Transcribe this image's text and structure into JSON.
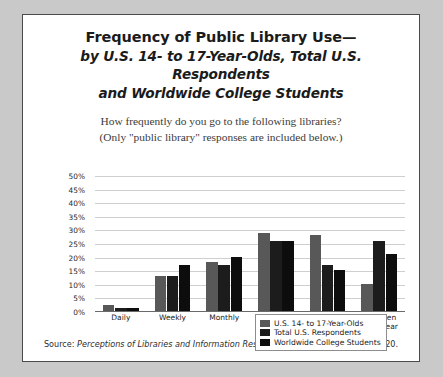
{
  "title": {
    "line1": "Frequency of Public Library Use—",
    "line2": "by U.S. 14- to 17-Year-Olds, Total U.S. Respondents",
    "line3": "and Worldwide College Students"
  },
  "subtitle": {
    "line1": "How frequently do you go to the following libraries?",
    "line2": "(Only \"public library\" responses are included below.)"
  },
  "source": {
    "prefix": "Source:",
    "italic": "Perceptions of Libraries and Information Resources",
    "suffix": ", OCLC, 2005, question 820."
  },
  "colors": {
    "series_0": "#585858",
    "series_1": "#1c1c1c",
    "series_2": "#0d0d0d",
    "panel_background": "#ffffff",
    "page_background": "#c9c9c9",
    "panel_border": "#4a4a4a",
    "gridline": "#cfcfcf",
    "axis": "#6a6a6a"
  },
  "chart_data": {
    "type": "bar",
    "title": "Frequency of Public Library Use— by U.S. 14- to 17-Year-Olds, Total U.S. Respondents and Worldwide College Students",
    "subtitle": "How frequently do you go to the following libraries? (Only \"public library\" responses are included below.)",
    "xlabel": "",
    "ylabel": "",
    "ylim": [
      0,
      50
    ],
    "ytick_labels": [
      "50%",
      "45%",
      "40%",
      "35%",
      "30%",
      "25%",
      "20%",
      "15%",
      "10%",
      "5%",
      "0%"
    ],
    "ytick_values": [
      50,
      45,
      40,
      35,
      30,
      25,
      20,
      15,
      10,
      5,
      0
    ],
    "grid": true,
    "legend_position": "top-right",
    "categories": [
      "Daily",
      "Weekly",
      "Monthly",
      "Several times/\nyear",
      "At least\nonce/year",
      "Not even\nonce/year"
    ],
    "series": [
      {
        "name": "U.S. 14- to 17-Year-Olds",
        "color": "#585858",
        "values": [
          2,
          13,
          18,
          29,
          28,
          10
        ]
      },
      {
        "name": "Total U.S. Respondents",
        "color": "#1c1c1c",
        "values": [
          1,
          13,
          17,
          26,
          17,
          26
        ]
      },
      {
        "name": "Worldwide College Students",
        "color": "#0d0d0d",
        "values": [
          1,
          17,
          20,
          26,
          15,
          21
        ]
      }
    ]
  }
}
